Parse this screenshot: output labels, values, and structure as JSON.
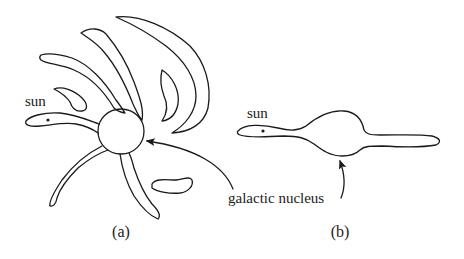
{
  "figure": {
    "panel_a": {
      "caption": "(a)",
      "sun_label": "sun",
      "description": "spiral galaxy viewed face-on with arms radiating from central nucleus"
    },
    "panel_b": {
      "caption": "(b)",
      "sun_label": "sun",
      "description": "galaxy viewed edge-on with central bulge"
    },
    "shared_label": "galactic nucleus",
    "colors": {
      "line": "#1a1a1a",
      "background": "#ffffff"
    }
  }
}
